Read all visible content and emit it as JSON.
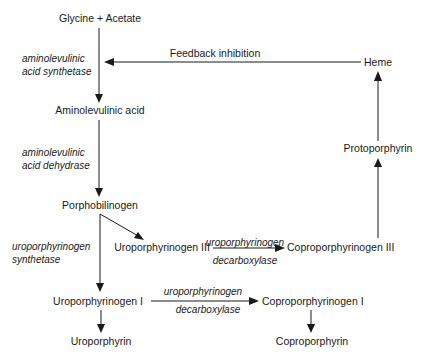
{
  "diagram": {
    "nodes": {
      "glycine_acetate": "Glycine + Acetate",
      "aminolevulinic_acid": "Aminolevulinic acid",
      "porphobilinogen": "Porphobilinogen",
      "uroporphyrinogen_iii": "Uroporphyrinogen III",
      "coproporphyrinogen_iii": "Coproporphyrinogen III",
      "protoporphyrin": "Protoporphyrin",
      "heme": "Heme",
      "uroporphyrinogen_i": "Uroporphyrinogen I",
      "coproporphyrinogen_i": "Coproporphyrinogen I",
      "uroporphyrin": "Uroporphyrin",
      "coproporphyrin": "Coproporphyrin"
    },
    "enzymes": {
      "ala_synthetase_1": "aminolevulinic",
      "ala_synthetase_2": "acid synthetase",
      "ala_dehydrase_1": "aminolevulinic",
      "ala_dehydrase_2": "acid dehydrase",
      "uro_synthetase_1": "uroporphyrinogen",
      "uro_synthetase_2": "synthetase",
      "uro_decarb_iii_1": "uroporphyrinogen",
      "uro_decarb_iii_2": "decarboxylase",
      "uro_decarb_i_1": "uroporphyrinogen",
      "uro_decarb_i_2": "decarboxylase"
    },
    "annotations": {
      "feedback": "Feedback inhibition"
    },
    "edges": [
      {
        "from": "glycine_acetate",
        "to": "aminolevulinic_acid",
        "enzyme": "aminolevulinic acid synthetase"
      },
      {
        "from": "aminolevulinic_acid",
        "to": "porphobilinogen",
        "enzyme": "aminolevulinic acid dehydrase"
      },
      {
        "from": "porphobilinogen",
        "to": "uroporphyrinogen_iii"
      },
      {
        "from": "porphobilinogen",
        "to": "uroporphyrinogen_i",
        "enzyme": "uroporphyrinogen synthetase"
      },
      {
        "from": "uroporphyrinogen_iii",
        "to": "coproporphyrinogen_iii",
        "enzyme": "uroporphyrinogen decarboxylase"
      },
      {
        "from": "coproporphyrinogen_iii",
        "to": "protoporphyrin"
      },
      {
        "from": "protoporphyrin",
        "to": "heme"
      },
      {
        "from": "heme",
        "to": "glycine_acetate-step",
        "label": "Feedback inhibition"
      },
      {
        "from": "uroporphyrinogen_i",
        "to": "coproporphyrinogen_i",
        "enzyme": "uroporphyrinogen decarboxylase"
      },
      {
        "from": "uroporphyrinogen_i",
        "to": "uroporphyrin"
      },
      {
        "from": "coproporphyrinogen_i",
        "to": "coproporphyrin"
      }
    ]
  }
}
